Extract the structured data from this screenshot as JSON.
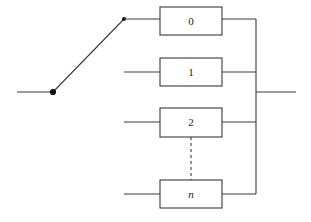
{
  "figure": {
    "type": "block-diagram",
    "background_color": "#ffffff",
    "stroke_color": "#3a3a3a",
    "text_color": "#1a1a1a",
    "line_width": 1.1,
    "width": 311,
    "height": 222
  },
  "switch": {
    "name": "selector-switch",
    "input_line": {
      "x1": 17,
      "y1": 92,
      "x2": 53,
      "y2": 92
    },
    "pivot_dot": {
      "cx": 53,
      "cy": 92,
      "r": 3.1
    },
    "arm": {
      "x1": 53,
      "y1": 92,
      "x2": 124,
      "y2": 19
    },
    "contact_dot": {
      "cx": 124,
      "cy": 19,
      "r": 2.0
    }
  },
  "blocks": [
    {
      "label": "0",
      "italic": false,
      "x": 160,
      "y": 7,
      "width": 62,
      "height": 28,
      "label_x": 191,
      "label_y": 22,
      "input_stub": {
        "x1": 124,
        "y1": 19,
        "x2": 160,
        "y2": 19,
        "visible": false
      },
      "output_stub": {
        "x1": 222,
        "y1": 19,
        "x2": 256,
        "y2": 19
      }
    },
    {
      "label": "1",
      "italic": false,
      "x": 160,
      "y": 58,
      "width": 62,
      "height": 28,
      "label_x": 191,
      "label_y": 73,
      "input_stub": {
        "x1": 124,
        "y1": 72,
        "x2": 160,
        "y2": 72,
        "visible": true
      },
      "output_stub": {
        "x1": 222,
        "y1": 72,
        "x2": 256,
        "y2": 72
      }
    },
    {
      "label": "2",
      "italic": false,
      "x": 160,
      "y": 108,
      "width": 62,
      "height": 29,
      "label_x": 191,
      "label_y": 123,
      "input_stub": {
        "x1": 124,
        "y1": 122,
        "x2": 160,
        "y2": 122,
        "visible": true
      },
      "output_stub": {
        "x1": 222,
        "y1": 122,
        "x2": 256,
        "y2": 122
      }
    },
    {
      "label": "n",
      "italic": true,
      "x": 160,
      "y": 180,
      "width": 62,
      "height": 28,
      "label_x": 191,
      "label_y": 195,
      "input_stub": {
        "x1": 124,
        "y1": 194,
        "x2": 160,
        "y2": 194,
        "visible": true
      },
      "output_stub": {
        "x1": 222,
        "y1": 194,
        "x2": 256,
        "y2": 194
      }
    }
  ],
  "switch_lead": {
    "x1": 124,
    "y1": 19,
    "x2": 160,
    "y2": 19
  },
  "ellipsis": {
    "name": "vertical-dashed-ellipsis",
    "x": 191,
    "y1": 137,
    "y2": 180,
    "dash_pattern": "3,3"
  },
  "bus": {
    "name": "output-bus",
    "x": 256,
    "y1": 19,
    "y2": 194
  },
  "output": {
    "name": "output-line",
    "x1": 256,
    "y1": 92,
    "x2": 296,
    "y2": 92
  }
}
